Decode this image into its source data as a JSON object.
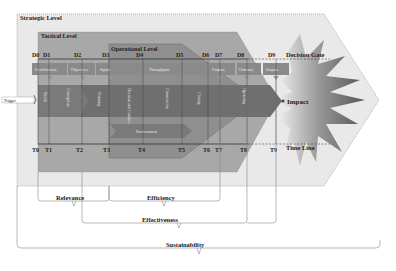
{
  "levels": {
    "strategic": "Strategic Level",
    "tactical": "Tactical Level",
    "operational": "Operational Level"
  },
  "decision_gate": {
    "label": "Decision Gate",
    "ticks": [
      "D0",
      "D1",
      "D2",
      "D3",
      "D4",
      "D5",
      "D6",
      "D7",
      "D8",
      "D9"
    ]
  },
  "time_line": {
    "label": "Time Line",
    "ticks": [
      "T0",
      "T1",
      "T2",
      "T3",
      "T4",
      "T5",
      "T6",
      "T7",
      "T8",
      "T9"
    ]
  },
  "top_boxes": [
    "Identification",
    "Objectives",
    "Inputs",
    "Throughputs",
    "Outputs",
    "Outcome",
    "Purpose"
  ],
  "phase_arrows": [
    "Needs",
    "Conception",
    "Planning",
    "Decision and Contract",
    "Construction",
    "Closing",
    "Operating"
  ],
  "environment_label": "Environment",
  "trigger_label": "Trigger",
  "impact_label": "Impact",
  "evaluation_criteria": {
    "relevance": "Relevance",
    "efficiency": "Efficiency",
    "effectiveness": "Effectiveness",
    "sustainability": "Sustainability"
  },
  "colors": {
    "strategic_fill": "#e8e8e8",
    "tactical_fill": "#a6a6a6",
    "operational_fill": "#8c8c8c",
    "arrow_fill": "#6e6e6e",
    "box_fill": "#8a8a8a",
    "text_dark": "#222222"
  }
}
